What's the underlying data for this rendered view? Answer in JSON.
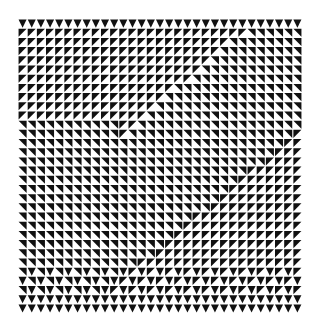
{
  "artwork": {
    "type": "op-art triangle grid",
    "background": "#ffffff",
    "ink": "#111111",
    "grid": {
      "cols": 31,
      "rows": 32,
      "cell_w": 9.16,
      "cell_h": 9.19,
      "left": 18,
      "top": 19
    },
    "regions": [
      {
        "name": "top-edge",
        "pattern": "down-triangle"
      },
      {
        "name": "top-band",
        "pattern": "black-top-left"
      },
      {
        "name": "middle-left",
        "pattern": "black-top-right"
      },
      {
        "name": "middle-right",
        "pattern": "black-top-left"
      },
      {
        "name": "lower-band",
        "pattern": "black-top-right"
      },
      {
        "name": "bottom-edge",
        "pattern": "down-triangle"
      }
    ]
  }
}
